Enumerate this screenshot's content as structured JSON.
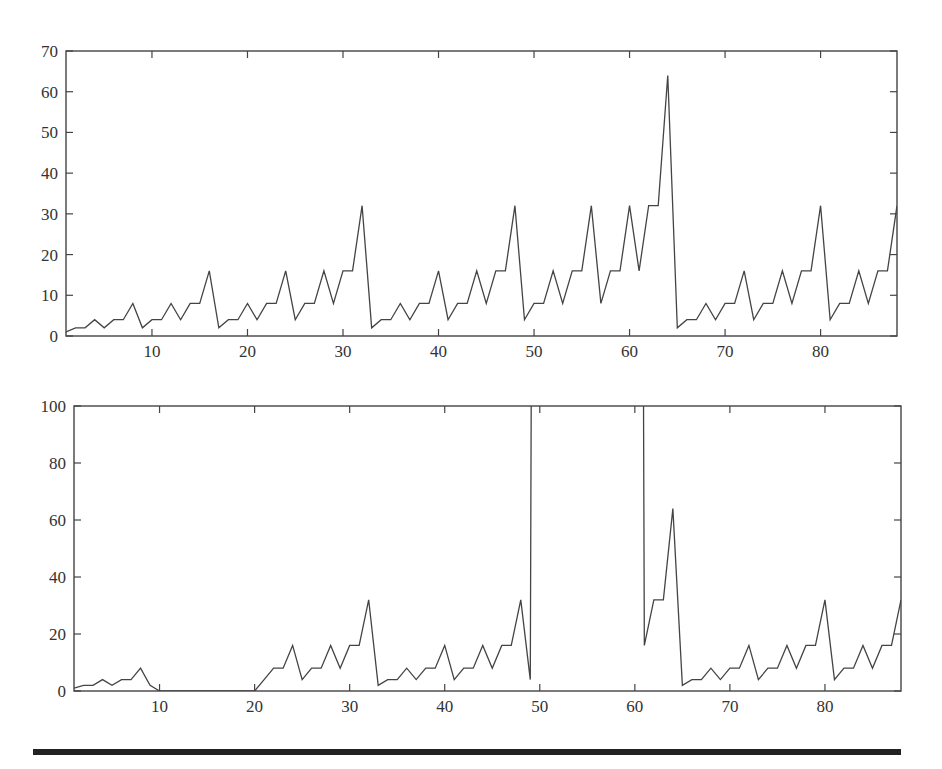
{
  "chart_data": [
    {
      "type": "line",
      "title": "",
      "xlabel": "",
      "ylabel": "",
      "xlim": [
        1,
        88
      ],
      "ylim": [
        0,
        70
      ],
      "xticks": [
        10,
        20,
        30,
        40,
        50,
        60,
        70,
        80
      ],
      "yticks": [
        0,
        10,
        20,
        30,
        40,
        50,
        60,
        70
      ],
      "grid": false,
      "legend": null,
      "x": [
        1,
        2,
        3,
        4,
        5,
        6,
        7,
        8,
        9,
        10,
        11,
        12,
        13,
        14,
        15,
        16,
        17,
        18,
        19,
        20,
        21,
        22,
        23,
        24,
        25,
        26,
        27,
        28,
        29,
        30,
        31,
        32,
        33,
        34,
        35,
        36,
        37,
        38,
        39,
        40,
        41,
        42,
        43,
        44,
        45,
        46,
        47,
        48,
        49,
        50,
        51,
        52,
        53,
        54,
        55,
        56,
        57,
        58,
        59,
        60,
        61,
        62,
        63,
        64,
        65,
        66,
        67,
        68,
        69,
        70,
        71,
        72,
        73,
        74,
        75,
        76,
        77,
        78,
        79,
        80,
        81,
        82,
        83,
        84,
        85,
        86,
        87,
        88
      ],
      "values": [
        1,
        2,
        2,
        4,
        2,
        4,
        4,
        8,
        2,
        4,
        4,
        8,
        4,
        8,
        8,
        16,
        2,
        4,
        4,
        8,
        4,
        8,
        8,
        16,
        4,
        8,
        8,
        16,
        8,
        16,
        16,
        32,
        2,
        4,
        4,
        8,
        4,
        8,
        8,
        16,
        4,
        8,
        8,
        16,
        8,
        16,
        16,
        32,
        4,
        8,
        8,
        16,
        8,
        16,
        16,
        32,
        8,
        16,
        16,
        32,
        16,
        32,
        32,
        64,
        2,
        4,
        4,
        8,
        4,
        8,
        8,
        16,
        4,
        8,
        8,
        16,
        8,
        16,
        16,
        32,
        4,
        8,
        8,
        16,
        8,
        16,
        16,
        32
      ]
    },
    {
      "type": "line",
      "title": "",
      "xlabel": "",
      "ylabel": "",
      "xlim": [
        1,
        88
      ],
      "ylim": [
        0,
        100
      ],
      "xticks": [
        10,
        20,
        30,
        40,
        50,
        60,
        70,
        80
      ],
      "yticks": [
        0,
        20,
        40,
        60,
        80,
        100
      ],
      "grid": false,
      "legend": null,
      "note": "values at x=50..60 exceed 100 and are clipped at top of plot",
      "x": [
        1,
        2,
        3,
        4,
        5,
        6,
        7,
        8,
        9,
        10,
        11,
        12,
        13,
        14,
        15,
        16,
        17,
        18,
        19,
        20,
        21,
        22,
        23,
        24,
        25,
        26,
        27,
        28,
        29,
        30,
        31,
        32,
        33,
        34,
        35,
        36,
        37,
        38,
        39,
        40,
        41,
        42,
        43,
        44,
        45,
        46,
        47,
        48,
        49,
        50,
        51,
        52,
        53,
        54,
        55,
        56,
        57,
        58,
        59,
        60,
        61,
        62,
        63,
        64,
        65,
        66,
        67,
        68,
        69,
        70,
        71,
        72,
        73,
        74,
        75,
        76,
        77,
        78,
        79,
        80,
        81,
        82,
        83,
        84,
        85,
        86,
        87,
        88
      ],
      "values": [
        1,
        2,
        2,
        4,
        2,
        4,
        4,
        8,
        2,
        0,
        0,
        0,
        0,
        0,
        0,
        0,
        0,
        0,
        0,
        0,
        4,
        8,
        8,
        16,
        4,
        8,
        8,
        16,
        8,
        16,
        16,
        32,
        2,
        4,
        4,
        8,
        4,
        8,
        8,
        16,
        4,
        8,
        8,
        16,
        8,
        16,
        16,
        32,
        4,
        1000,
        1000,
        1000,
        1000,
        1000,
        1000,
        1000,
        1000,
        1000,
        1000,
        1000,
        16,
        32,
        32,
        64,
        2,
        4,
        4,
        8,
        4,
        8,
        8,
        16,
        4,
        8,
        8,
        16,
        8,
        16,
        16,
        32,
        4,
        8,
        8,
        16,
        8,
        16,
        16,
        32
      ]
    }
  ],
  "layout": {
    "panels": [
      {
        "left": 66,
        "top": 51,
        "right": 897,
        "bottom": 336
      },
      {
        "left": 74,
        "top": 406,
        "right": 901,
        "bottom": 691
      }
    ]
  }
}
